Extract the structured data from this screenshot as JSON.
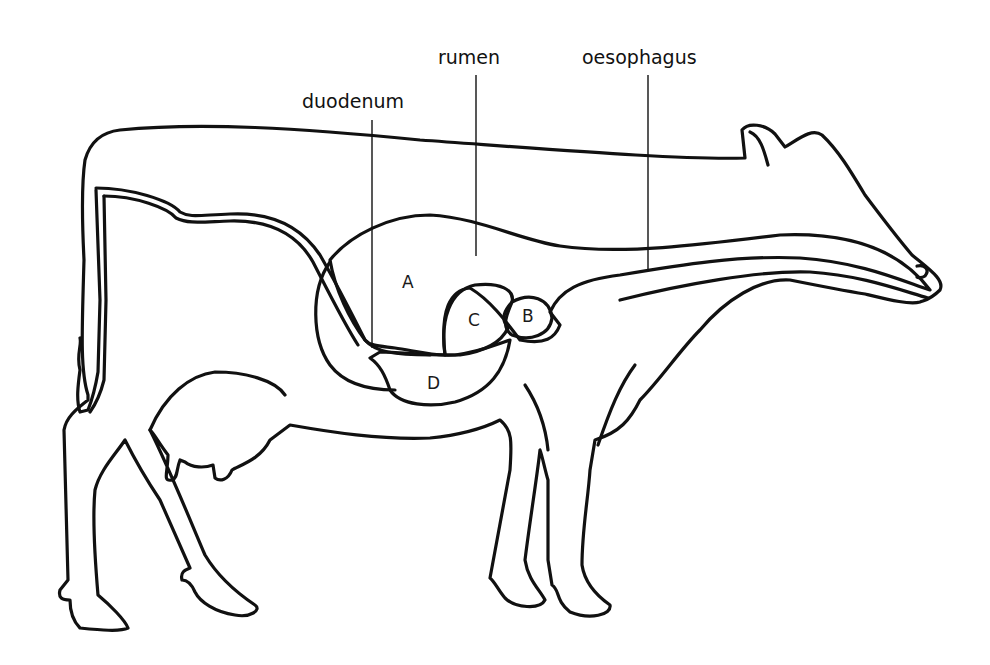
{
  "diagram": {
    "colors": {
      "background": "#ffffff",
      "body_fill_top": "#e6e6e6",
      "body_fill_bottom": "#8e8e8e",
      "stomach_fill": "#ececec",
      "outline": "#111111"
    },
    "callouts": [
      {
        "id": "duodenum",
        "label": "duodenum"
      },
      {
        "id": "rumen",
        "label": "rumen"
      },
      {
        "id": "oesophagus",
        "label": "oesophagus"
      }
    ],
    "chambers": [
      {
        "id": "A",
        "label": "A"
      },
      {
        "id": "B",
        "label": "B"
      },
      {
        "id": "C",
        "label": "C"
      },
      {
        "id": "D",
        "label": "D"
      }
    ]
  }
}
